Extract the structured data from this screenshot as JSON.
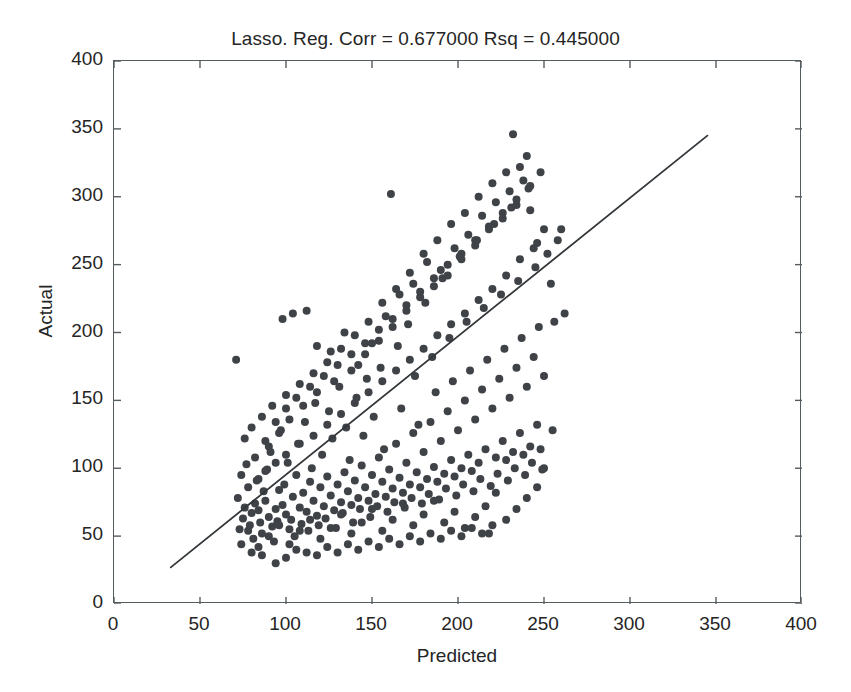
{
  "chart_data": {
    "type": "scatter",
    "title": "Lasso. Reg. Corr = 0.677000 Rsq = 0.445000",
    "xlabel": "Predicted",
    "ylabel": "Actual",
    "xlim": [
      0,
      400
    ],
    "ylim": [
      0,
      400
    ],
    "xticks": [
      0,
      50,
      100,
      150,
      200,
      250,
      300,
      350,
      400
    ],
    "yticks": [
      0,
      50,
      100,
      150,
      200,
      250,
      300,
      350,
      400
    ],
    "grid": false,
    "legend": "none",
    "statistics": {
      "corr": 0.677,
      "rsq": 0.445,
      "model": "Lasso. Reg."
    },
    "marker": {
      "shape": "circle",
      "color": "#3f4347",
      "size_px": 8,
      "filled": true
    },
    "fit_line": {
      "label": "identity / regression line",
      "color": "#33373a",
      "width_px": 1.8,
      "x_start": 33,
      "y_start": 27,
      "x_end": 345,
      "y_end": 345
    },
    "n_points": 352,
    "points": [
      [
        72,
        78
      ],
      [
        75,
        63
      ],
      [
        73,
        55
      ],
      [
        76,
        71
      ],
      [
        78,
        86
      ],
      [
        74,
        95
      ],
      [
        71,
        180
      ],
      [
        77,
        103
      ],
      [
        80,
        67
      ],
      [
        82,
        74
      ],
      [
        79,
        58
      ],
      [
        83,
        91
      ],
      [
        85,
        60
      ],
      [
        81,
        48
      ],
      [
        84,
        69
      ],
      [
        87,
        83
      ],
      [
        86,
        52
      ],
      [
        88,
        76
      ],
      [
        90,
        64
      ],
      [
        89,
        99
      ],
      [
        92,
        57
      ],
      [
        91,
        112
      ],
      [
        94,
        70
      ],
      [
        93,
        46
      ],
      [
        96,
        84
      ],
      [
        95,
        61
      ],
      [
        98,
        73
      ],
      [
        97,
        128
      ],
      [
        100,
        66
      ],
      [
        99,
        88
      ],
      [
        102,
        55
      ],
      [
        101,
        104
      ],
      [
        104,
        79
      ],
      [
        103,
        62
      ],
      [
        106,
        95
      ],
      [
        105,
        50
      ],
      [
        108,
        71
      ],
      [
        107,
        118
      ],
      [
        110,
        82
      ],
      [
        109,
        59
      ],
      [
        112,
        68
      ],
      [
        111,
        134
      ],
      [
        114,
        90
      ],
      [
        113,
        54
      ],
      [
        116,
        76
      ],
      [
        115,
        100
      ],
      [
        118,
        65
      ],
      [
        117,
        148
      ],
      [
        120,
        86
      ],
      [
        119,
        58
      ],
      [
        122,
        72
      ],
      [
        121,
        110
      ],
      [
        124,
        94
      ],
      [
        123,
        63
      ],
      [
        126,
        80
      ],
      [
        125,
        142
      ],
      [
        128,
        69
      ],
      [
        127,
        122
      ],
      [
        130,
        88
      ],
      [
        129,
        56
      ],
      [
        132,
        75
      ],
      [
        131,
        160
      ],
      [
        134,
        97
      ],
      [
        133,
        67
      ],
      [
        136,
        83
      ],
      [
        135,
        130
      ],
      [
        138,
        73
      ],
      [
        137,
        106
      ],
      [
        140,
        91
      ],
      [
        139,
        60
      ],
      [
        142,
        78
      ],
      [
        141,
        152
      ],
      [
        144,
        102
      ],
      [
        143,
        70
      ],
      [
        146,
        86
      ],
      [
        145,
        124
      ],
      [
        148,
        76
      ],
      [
        147,
        166
      ],
      [
        150,
        95
      ],
      [
        149,
        64
      ],
      [
        152,
        81
      ],
      [
        151,
        138
      ],
      [
        154,
        108
      ],
      [
        153,
        72
      ],
      [
        156,
        90
      ],
      [
        155,
        174
      ],
      [
        158,
        79
      ],
      [
        157,
        114
      ],
      [
        160,
        99
      ],
      [
        159,
        68
      ],
      [
        162,
        85
      ],
      [
        161,
        302
      ],
      [
        164,
        118
      ],
      [
        163,
        75
      ],
      [
        166,
        93
      ],
      [
        165,
        190
      ],
      [
        168,
        82
      ],
      [
        167,
        144
      ],
      [
        170,
        104
      ],
      [
        169,
        71
      ],
      [
        172,
        88
      ],
      [
        171,
        206
      ],
      [
        174,
        126
      ],
      [
        173,
        78
      ],
      [
        176,
        97
      ],
      [
        175,
        168
      ],
      [
        178,
        86
      ],
      [
        177,
        132
      ],
      [
        180,
        112
      ],
      [
        179,
        74
      ],
      [
        182,
        92
      ],
      [
        181,
        222
      ],
      [
        184,
        134
      ],
      [
        183,
        81
      ],
      [
        186,
        101
      ],
      [
        185,
        182
      ],
      [
        188,
        90
      ],
      [
        187,
        156
      ],
      [
        190,
        120
      ],
      [
        189,
        77
      ],
      [
        192,
        96
      ],
      [
        191,
        240
      ],
      [
        194,
        142
      ],
      [
        193,
        85
      ],
      [
        196,
        106
      ],
      [
        195,
        196
      ],
      [
        198,
        94
      ],
      [
        197,
        164
      ],
      [
        200,
        128
      ],
      [
        199,
        80
      ],
      [
        202,
        100
      ],
      [
        201,
        256
      ],
      [
        204,
        150
      ],
      [
        203,
        88
      ],
      [
        206,
        110
      ],
      [
        205,
        208
      ],
      [
        208,
        98
      ],
      [
        207,
        172
      ],
      [
        210,
        136
      ],
      [
        209,
        83
      ],
      [
        212,
        104
      ],
      [
        211,
        268
      ],
      [
        214,
        158
      ],
      [
        213,
        92
      ],
      [
        216,
        114
      ],
      [
        215,
        218
      ],
      [
        218,
        52
      ],
      [
        217,
        180
      ],
      [
        220,
        144
      ],
      [
        219,
        87
      ],
      [
        222,
        108
      ],
      [
        221,
        280
      ],
      [
        224,
        166
      ],
      [
        223,
        96
      ],
      [
        226,
        120
      ],
      [
        225,
        228
      ],
      [
        228,
        106
      ],
      [
        227,
        188
      ],
      [
        230,
        152
      ],
      [
        229,
        91
      ],
      [
        232,
        112
      ],
      [
        231,
        292
      ],
      [
        234,
        174
      ],
      [
        233,
        100
      ],
      [
        236,
        126
      ],
      [
        235,
        238
      ],
      [
        238,
        110
      ],
      [
        237,
        196
      ],
      [
        240,
        160
      ],
      [
        239,
        95
      ],
      [
        242,
        116
      ],
      [
        241,
        306
      ],
      [
        244,
        182
      ],
      [
        243,
        104
      ],
      [
        246,
        132
      ],
      [
        245,
        248
      ],
      [
        248,
        114
      ],
      [
        247,
        204
      ],
      [
        250,
        168
      ],
      [
        249,
        99
      ],
      [
        98,
        210
      ],
      [
        104,
        214
      ],
      [
        112,
        216
      ],
      [
        118,
        190
      ],
      [
        126,
        186
      ],
      [
        134,
        200
      ],
      [
        142,
        176
      ],
      [
        150,
        192
      ],
      [
        158,
        212
      ],
      [
        166,
        228
      ],
      [
        174,
        236
      ],
      [
        182,
        252
      ],
      [
        190,
        246
      ],
      [
        198,
        262
      ],
      [
        206,
        272
      ],
      [
        214,
        286
      ],
      [
        222,
        296
      ],
      [
        230,
        304
      ],
      [
        238,
        312
      ],
      [
        246,
        266
      ],
      [
        232,
        346
      ],
      [
        240,
        330
      ],
      [
        236,
        322
      ],
      [
        228,
        318
      ],
      [
        220,
        310
      ],
      [
        212,
        300
      ],
      [
        204,
        288
      ],
      [
        196,
        280
      ],
      [
        188,
        268
      ],
      [
        180,
        258
      ],
      [
        172,
        244
      ],
      [
        164,
        232
      ],
      [
        156,
        222
      ],
      [
        148,
        208
      ],
      [
        140,
        198
      ],
      [
        132,
        188
      ],
      [
        124,
        178
      ],
      [
        116,
        170
      ],
      [
        108,
        162
      ],
      [
        100,
        154
      ],
      [
        92,
        146
      ],
      [
        86,
        138
      ],
      [
        80,
        130
      ],
      [
        76,
        122
      ],
      [
        90,
        116
      ],
      [
        96,
        126
      ],
      [
        102,
        136
      ],
      [
        110,
        146
      ],
      [
        118,
        156
      ],
      [
        128,
        164
      ],
      [
        138,
        172
      ],
      [
        146,
        184
      ],
      [
        154,
        194
      ],
      [
        162,
        204
      ],
      [
        170,
        216
      ],
      [
        178,
        226
      ],
      [
        186,
        234
      ],
      [
        194,
        242
      ],
      [
        202,
        254
      ],
      [
        210,
        264
      ],
      [
        218,
        276
      ],
      [
        226,
        284
      ],
      [
        234,
        294
      ],
      [
        242,
        290
      ],
      [
        250,
        276
      ],
      [
        244,
        262
      ],
      [
        236,
        254
      ],
      [
        228,
        242
      ],
      [
        220,
        232
      ],
      [
        212,
        224
      ],
      [
        204,
        214
      ],
      [
        196,
        206
      ],
      [
        188,
        198
      ],
      [
        180,
        188
      ],
      [
        172,
        180
      ],
      [
        164,
        172
      ],
      [
        156,
        164
      ],
      [
        148,
        156
      ],
      [
        140,
        148
      ],
      [
        132,
        140
      ],
      [
        124,
        132
      ],
      [
        116,
        124
      ],
      [
        108,
        118
      ],
      [
        100,
        110
      ],
      [
        94,
        104
      ],
      [
        88,
        98
      ],
      [
        84,
        92
      ],
      [
        82,
        108
      ],
      [
        88,
        120
      ],
      [
        94,
        134
      ],
      [
        100,
        144
      ],
      [
        106,
        152
      ],
      [
        114,
        160
      ],
      [
        122,
        168
      ],
      [
        130,
        176
      ],
      [
        138,
        184
      ],
      [
        146,
        192
      ],
      [
        154,
        202
      ],
      [
        162,
        210
      ],
      [
        170,
        220
      ],
      [
        178,
        230
      ],
      [
        186,
        240
      ],
      [
        194,
        250
      ],
      [
        202,
        258
      ],
      [
        210,
        268
      ],
      [
        218,
        278
      ],
      [
        226,
        288
      ],
      [
        234,
        298
      ],
      [
        242,
        308
      ],
      [
        248,
        318
      ],
      [
        252,
        258
      ],
      [
        254,
        236
      ],
      [
        256,
        208
      ],
      [
        258,
        268
      ],
      [
        260,
        276
      ],
      [
        262,
        214
      ],
      [
        255,
        128
      ],
      [
        250,
        100
      ],
      [
        246,
        86
      ],
      [
        240,
        78
      ],
      [
        234,
        70
      ],
      [
        228,
        62
      ],
      [
        222,
        82
      ],
      [
        216,
        72
      ],
      [
        210,
        64
      ],
      [
        204,
        56
      ],
      [
        198,
        68
      ],
      [
        192,
        60
      ],
      [
        186,
        76
      ],
      [
        180,
        66
      ],
      [
        174,
        58
      ],
      [
        168,
        74
      ],
      [
        162,
        62
      ],
      [
        156,
        54
      ],
      [
        150,
        70
      ],
      [
        144,
        60
      ],
      [
        138,
        52
      ],
      [
        132,
        66
      ],
      [
        126,
        56
      ],
      [
        120,
        48
      ],
      [
        114,
        62
      ],
      [
        108,
        54
      ],
      [
        102,
        44
      ],
      [
        96,
        58
      ],
      [
        90,
        50
      ],
      [
        84,
        42
      ],
      [
        78,
        54
      ],
      [
        74,
        44
      ],
      [
        80,
        38
      ],
      [
        86,
        36
      ],
      [
        94,
        30
      ],
      [
        100,
        34
      ],
      [
        106,
        40
      ],
      [
        112,
        38
      ],
      [
        118,
        36
      ],
      [
        124,
        42
      ],
      [
        130,
        38
      ],
      [
        136,
        44
      ],
      [
        142,
        40
      ],
      [
        148,
        46
      ],
      [
        154,
        42
      ],
      [
        160,
        48
      ],
      [
        166,
        44
      ],
      [
        172,
        50
      ],
      [
        178,
        46
      ],
      [
        184,
        52
      ],
      [
        190,
        48
      ],
      [
        196,
        54
      ],
      [
        202,
        50
      ],
      [
        208,
        56
      ],
      [
        214,
        52
      ],
      [
        220,
        58
      ]
    ]
  }
}
